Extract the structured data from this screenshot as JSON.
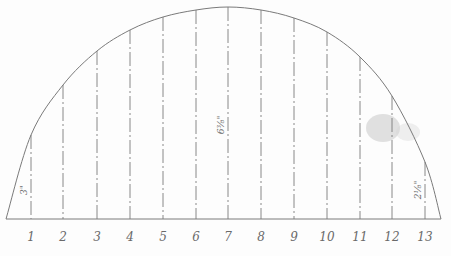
{
  "diagram": {
    "type": "technical-drawing",
    "baseline": {
      "x1": 6,
      "x2": 441,
      "y": 219
    },
    "apex": {
      "x": 228,
      "y": 7
    },
    "ink_color": "#7a7a7a",
    "smudge_color": "#c8c8c8",
    "stations": [
      {
        "label": "1",
        "x": 31,
        "top": 135
      },
      {
        "label": "2",
        "x": 63,
        "top": 85
      },
      {
        "label": "3",
        "x": 97,
        "top": 51
      },
      {
        "label": "4",
        "x": 130,
        "top": 30
      },
      {
        "label": "5",
        "x": 163,
        "top": 17
      },
      {
        "label": "6",
        "x": 196,
        "top": 10
      },
      {
        "label": "7",
        "x": 228,
        "top": 7
      },
      {
        "label": "8",
        "x": 261,
        "top": 10
      },
      {
        "label": "9",
        "x": 294,
        "top": 18
      },
      {
        "label": "10",
        "x": 327,
        "top": 32
      },
      {
        "label": "11",
        "x": 360,
        "top": 57
      },
      {
        "label": "12",
        "x": 392,
        "top": 96
      },
      {
        "label": "13",
        "x": 425,
        "top": 162
      }
    ],
    "dimensions": [
      {
        "text": "3\"",
        "x": 27,
        "y": 190
      },
      {
        "text": "6⅜\"",
        "x": 224,
        "y": 125
      },
      {
        "text": "2⅛\"",
        "x": 421,
        "y": 190
      }
    ]
  }
}
